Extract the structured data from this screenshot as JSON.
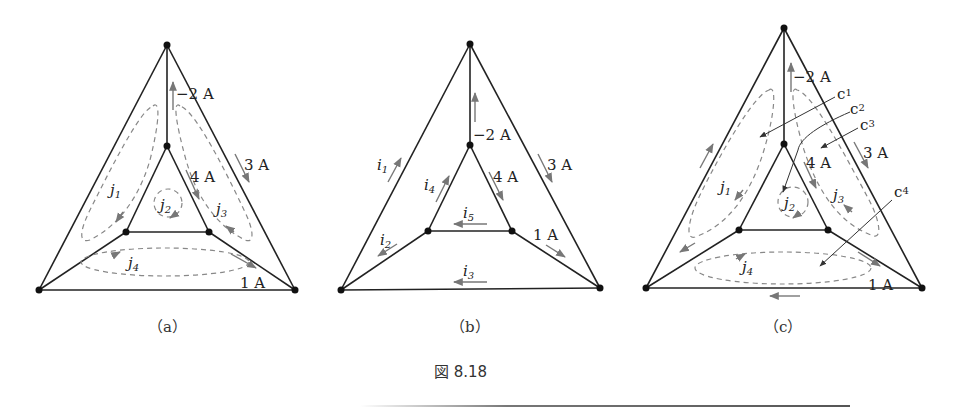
{
  "figure": {
    "caption": "図 8.18",
    "panels": [
      {
        "id": "a",
        "label": "（a）",
        "currents": {
          "top_vertical": "−2 A",
          "right_outer": "3 A",
          "right_inner": "4 A",
          "bottom_right_spoke": "1 A"
        },
        "loops": [
          {
            "name": "j",
            "sub": "1"
          },
          {
            "name": "j",
            "sub": "2"
          },
          {
            "name": "j",
            "sub": "3"
          },
          {
            "name": "j",
            "sub": "4"
          }
        ]
      },
      {
        "id": "b",
        "label": "（b）",
        "currents": {
          "top_vertical": "−2 A",
          "right_outer": "3 A",
          "right_inner": "4 A",
          "bottom_right_spoke": "1 A"
        },
        "unknowns": [
          {
            "name": "i",
            "sub": "1"
          },
          {
            "name": "i",
            "sub": "2"
          },
          {
            "name": "i",
            "sub": "3"
          },
          {
            "name": "i",
            "sub": "4"
          },
          {
            "name": "i",
            "sub": "5"
          }
        ]
      },
      {
        "id": "c",
        "label": "（c）",
        "currents": {
          "top_vertical": "−2 A",
          "right_outer": "3 A",
          "right_inner": "4 A",
          "bottom_right_spoke": "1 A"
        },
        "loops": [
          {
            "name": "j",
            "sub": "1"
          },
          {
            "name": "j",
            "sub": "2"
          },
          {
            "name": "j",
            "sub": "3"
          },
          {
            "name": "j",
            "sub": "4"
          }
        ],
        "callouts": [
          {
            "name": "c",
            "sub": "1"
          },
          {
            "name": "c",
            "sub": "2"
          },
          {
            "name": "c",
            "sub": "3"
          },
          {
            "name": "c",
            "sub": "4"
          }
        ]
      }
    ]
  }
}
